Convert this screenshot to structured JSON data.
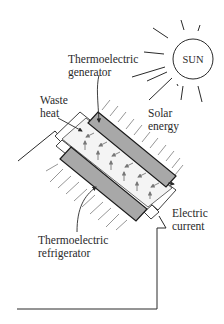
{
  "diagram": {
    "type": "schematic",
    "sun": {
      "label": "SUN"
    },
    "labels": {
      "generator": [
        "Thermoelectric",
        "generator"
      ],
      "solar_energy": [
        "Solar",
        "energy"
      ],
      "waste_heat": [
        "Waste",
        "heat"
      ],
      "refrigerator": [
        "Thermoelectric",
        "refrigerator"
      ],
      "electric_current": [
        "Electric",
        "current"
      ]
    },
    "colors": {
      "stroke": "#2a2a2a",
      "panel_fill": "#a8a8a8",
      "arrow_gray": "#8a8a8a",
      "background": "#ffffff"
    }
  }
}
